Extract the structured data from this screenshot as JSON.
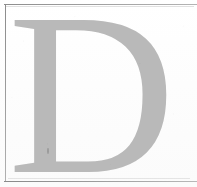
{
  "page": {
    "width": 197,
    "height": 187,
    "background_color": "#fefefe",
    "kind": "scanned-document-fragment"
  },
  "border": {
    "name": "rule-frame",
    "color": "#9a9a9a",
    "thickness_px": 1,
    "sides_visible": [
      "top",
      "left",
      "bottom"
    ],
    "right_side_visible": false
  },
  "dropcap": {
    "letter": "D",
    "color": "#b9b9b9",
    "typeface_style": "serif",
    "role": "decorative-initial",
    "approx_bounds": {
      "x": 22,
      "y": 13,
      "width": 154,
      "height": 159
    }
  },
  "artifacts": {
    "grain": "scanner-speckle",
    "ink_speck_label": "ink-density-speck"
  }
}
